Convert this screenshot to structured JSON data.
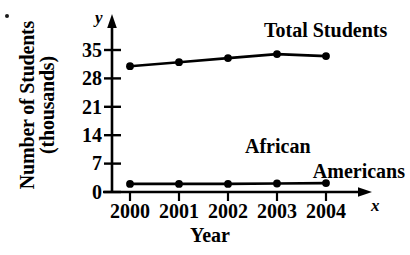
{
  "chart_data": {
    "type": "line",
    "title": "",
    "xlabel": "Year",
    "ylabel_lines": [
      "Number of Students",
      "(thousands)"
    ],
    "ylabel": "Number of Students (thousands)",
    "categories": [
      "2000",
      "2001",
      "2002",
      "2003",
      "2004"
    ],
    "x": [
      2000,
      2001,
      2002,
      2003,
      2004
    ],
    "yticks": [
      0,
      7,
      14,
      21,
      28,
      35
    ],
    "ylim": [
      0,
      38
    ],
    "xlim": [
      1999.6,
      2004.9
    ],
    "grid": false,
    "legend_position": "inline-annotations",
    "axis_letters": {
      "x": "x",
      "y": "y"
    },
    "markers": "filled-circle",
    "series": [
      {
        "name": "Total Students",
        "values": [
          31,
          32,
          33,
          34,
          33.5
        ],
        "color": "#000000",
        "annotation": "Total Students"
      },
      {
        "name": "African Americans",
        "values": [
          2,
          2,
          2,
          2.1,
          2.2
        ],
        "color": "#000000",
        "annotation_lines": [
          "African",
          "Americans"
        ],
        "annotation": "African Americans"
      }
    ]
  },
  "colors": {
    "background": "#ffffff",
    "ink": "#000000",
    "speck": "#1a1a1a"
  }
}
